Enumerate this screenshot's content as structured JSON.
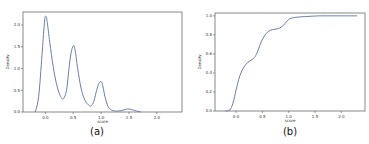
{
  "chart_data": [
    {
      "type": "line",
      "panel": "a",
      "caption": "(a)",
      "title": "",
      "xlabel": "score",
      "ylabel": "Density",
      "xlim": [
        -0.4,
        2.45
      ],
      "ylim": [
        0.0,
        2.3
      ],
      "xticks": [
        0.0,
        0.5,
        1.0,
        1.5,
        2.0
      ],
      "xtick_labels": [
        "0.0",
        "0.5",
        "1.0",
        "1.5",
        "2.0"
      ],
      "yticks": [
        0.0,
        0.5,
        1.0,
        1.5,
        2.0
      ],
      "ytick_labels": [
        "0.0",
        "0.5",
        "1.0",
        "1.5",
        "2.0"
      ],
      "grid": false,
      "series": [
        {
          "name": "KDE",
          "color": "#6b7fa8",
          "x": [
            -0.18,
            -0.12,
            -0.06,
            -0.02,
            0.0,
            0.03,
            0.08,
            0.14,
            0.2,
            0.26,
            0.32,
            0.38,
            0.42,
            0.46,
            0.5,
            0.53,
            0.58,
            0.64,
            0.7,
            0.76,
            0.82,
            0.87,
            0.92,
            0.96,
            1.0,
            1.03,
            1.07,
            1.12,
            1.18,
            1.26,
            1.36,
            1.44,
            1.5,
            1.56,
            1.64,
            1.72
          ],
          "y": [
            0.0,
            0.35,
            1.3,
            2.0,
            2.2,
            2.1,
            1.6,
            1.05,
            0.65,
            0.4,
            0.3,
            0.5,
            0.95,
            1.35,
            1.52,
            1.45,
            1.0,
            0.55,
            0.3,
            0.18,
            0.14,
            0.25,
            0.5,
            0.66,
            0.7,
            0.6,
            0.35,
            0.14,
            0.05,
            0.02,
            0.03,
            0.06,
            0.07,
            0.05,
            0.02,
            0.0
          ]
        }
      ]
    },
    {
      "type": "line",
      "panel": "b",
      "caption": "(b)",
      "title": "",
      "xlabel": "score",
      "ylabel": "Density",
      "xlim": [
        -0.4,
        2.45
      ],
      "ylim": [
        0.0,
        1.03
      ],
      "xticks": [
        0.0,
        0.5,
        1.0,
        1.5,
        2.0
      ],
      "xtick_labels": [
        "0.0",
        "0.5",
        "1.0",
        "1.5",
        "2.0"
      ],
      "yticks": [
        0.0,
        0.2,
        0.4,
        0.6,
        0.8,
        1.0
      ],
      "ytick_labels": [
        "0.0",
        "0.2",
        "0.4",
        "0.6",
        "0.8",
        "1.0"
      ],
      "grid": false,
      "series": [
        {
          "name": "CDF",
          "color": "#6b7fa8",
          "x": [
            -0.2,
            -0.12,
            -0.06,
            0.0,
            0.05,
            0.1,
            0.16,
            0.22,
            0.3,
            0.36,
            0.42,
            0.48,
            0.54,
            0.6,
            0.66,
            0.74,
            0.82,
            0.9,
            0.96,
            1.02,
            1.08,
            1.14,
            1.25,
            1.4,
            1.6,
            1.9,
            2.3
          ],
          "y": [
            0.0,
            0.01,
            0.08,
            0.22,
            0.33,
            0.41,
            0.47,
            0.51,
            0.54,
            0.57,
            0.64,
            0.73,
            0.79,
            0.83,
            0.85,
            0.86,
            0.87,
            0.9,
            0.94,
            0.97,
            0.98,
            0.985,
            0.99,
            0.995,
            1.0,
            1.0,
            1.0
          ]
        }
      ]
    }
  ]
}
